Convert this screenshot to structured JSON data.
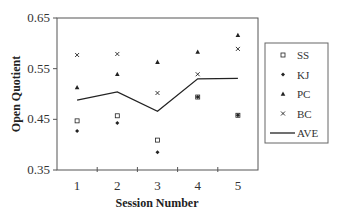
{
  "chart_data": {
    "type": "scatter",
    "title": "",
    "xlabel": "Session Number",
    "ylabel": "Open Quotient",
    "x": [
      1,
      2,
      3,
      4,
      5
    ],
    "x_tick_labels": [
      "1",
      "2",
      "3",
      "4",
      "5"
    ],
    "y_tick_labels": [
      "0.65",
      "0.55",
      "0.45",
      "0.35"
    ],
    "ylim": [
      0.35,
      0.65
    ],
    "xlim": [
      0.5,
      5.5
    ],
    "grid": false,
    "legend_position": "right",
    "series": [
      {
        "name": "SS",
        "marker": "open-square",
        "style": "marker",
        "values": [
          0.447,
          0.457,
          0.409,
          0.494,
          0.458
        ]
      },
      {
        "name": "KJ",
        "marker": "filled-diamond",
        "style": "marker",
        "values": [
          0.427,
          0.443,
          0.385,
          0.494,
          0.458
        ]
      },
      {
        "name": "PC",
        "marker": "filled-triangle",
        "style": "marker",
        "values": [
          0.513,
          0.539,
          0.563,
          0.583,
          0.616
        ]
      },
      {
        "name": "BC",
        "marker": "x-mark",
        "style": "marker",
        "values": [
          0.577,
          0.579,
          0.502,
          0.539,
          0.589
        ]
      },
      {
        "name": "AVE",
        "marker": "none",
        "style": "line",
        "values": [
          0.488,
          0.504,
          0.466,
          0.53,
          0.531
        ]
      }
    ]
  },
  "legend": {
    "items": [
      {
        "label": "SS",
        "symbol": "open-square"
      },
      {
        "label": "KJ",
        "symbol": "filled-diamond"
      },
      {
        "label": "PC",
        "symbol": "filled-triangle"
      },
      {
        "label": "BC",
        "symbol": "x-mark"
      },
      {
        "label": "AVE",
        "symbol": "line"
      }
    ]
  },
  "colors": {
    "axis": "#555555",
    "marker": "#222222",
    "line": "#222222",
    "legend_border": "#666666"
  }
}
